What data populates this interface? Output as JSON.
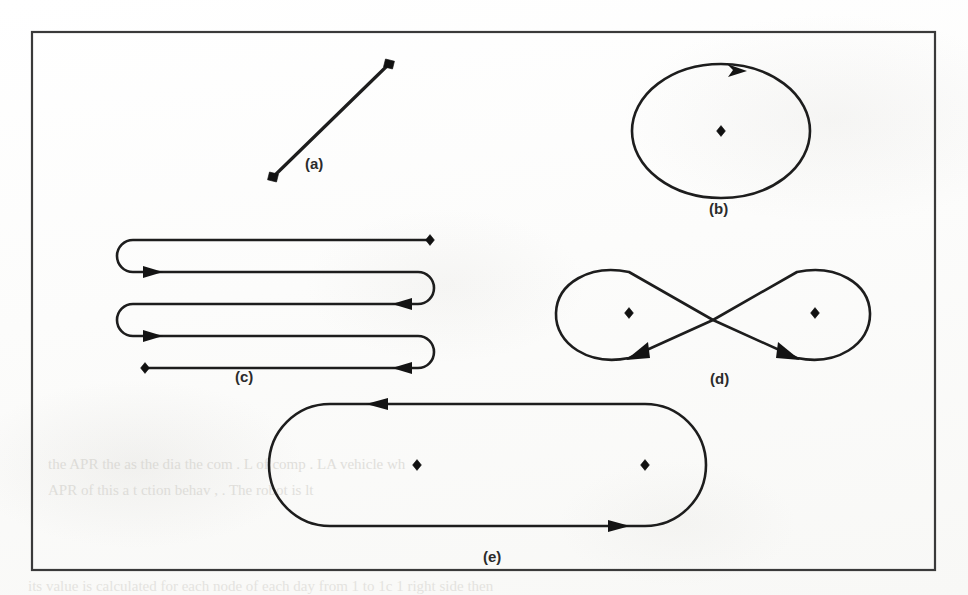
{
  "page": {
    "kind": "scanned-book-figure",
    "width": 968,
    "height": 595,
    "ink_color": "#1d1d1d",
    "paper_color": "#fdfdfc",
    "bleed_text_color": "#c9c7c1"
  },
  "figure": {
    "frame": {
      "x": 32,
      "y": 32,
      "width": 903,
      "height": 538,
      "border_color": "#3a3a3a",
      "border_width": 2
    },
    "caption_font_weight": "bold",
    "panels": [
      {
        "id": "a",
        "label": "(a)",
        "label_x": 305,
        "label_y": 155,
        "name": "single-line-segment",
        "description": "Straight line segment with square endpoint markers at both ends",
        "endpoint_markers": 2,
        "arrows": 0,
        "closed": false
      },
      {
        "id": "b",
        "label": "(b)",
        "label_x": 709,
        "label_y": 200,
        "name": "single-ellipse-loop",
        "description": "Closed elliptical loop traversed counter-clockwise with one interior diamond marker",
        "endpoint_markers": 1,
        "arrows": 1,
        "closed": true
      },
      {
        "id": "c",
        "label": "(c)",
        "label_x": 235,
        "label_y": 368,
        "name": "boustrophedon-serpentine-path",
        "description": "Serpentine back-and-forth sweep with four horizontal passes joined by U-turns; diamond markers at the start (bottom-left) and the end (top-right)",
        "endpoint_markers": 2,
        "arrows": 4,
        "passes": 4,
        "closed": false
      },
      {
        "id": "d",
        "label": "(d)",
        "label_x": 710,
        "label_y": 370,
        "name": "figure-eight-lemniscate",
        "description": "Crossing figure-eight with two lobes, each lobe containing a diamond marker; arrows indicate direction through the crossing",
        "endpoint_markers": 2,
        "arrows": 2,
        "closed": true
      },
      {
        "id": "e",
        "label": "(e)",
        "label_x": 483,
        "label_y": 548,
        "name": "stadium-racetrack-loop",
        "description": "Closed stadium (racetrack) loop enclosing two diamond markers, traversed counter-clockwise",
        "endpoint_markers": 2,
        "arrows": 2,
        "closed": true
      }
    ]
  },
  "bleed_through_text": [
    {
      "text": "the  APR  the  as  the   dia        the  com     .  L  of  comp       .  LA  vehicle  wh",
      "x": 48,
      "y": 456,
      "size": 15,
      "opacity": 0.52
    },
    {
      "text": "APR  of  this  a     t      ction  behav       ,      .   The  robot  is  lt",
      "x": 48,
      "y": 482,
      "size": 15,
      "opacity": 0.5
    },
    {
      "text": "its  value  is  calculated  for  each  node  of  each  day  from  1  to  1c  1  right  side  then",
      "x": 28,
      "y": 578,
      "size": 15,
      "opacity": 0.44
    }
  ]
}
